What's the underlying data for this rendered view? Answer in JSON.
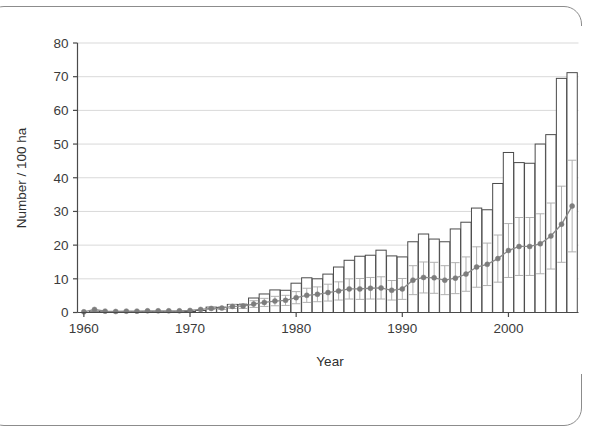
{
  "figure": {
    "background_color": "#ffffff",
    "frame_color": "#8c8c8c"
  },
  "chart_data": {
    "type": "bar",
    "title": "",
    "subtitle": "",
    "xlabel": "Year",
    "ylabel": "Number / 100 ha",
    "xlim": [
      1959.4,
      2006.6
    ],
    "ylim": [
      0,
      80
    ],
    "xticks": [
      1960,
      1970,
      1980,
      1990,
      2000
    ],
    "xtick_labels": [
      "1960",
      "1970",
      "1980",
      "1990",
      "2000"
    ],
    "yticks": [
      0,
      10,
      20,
      30,
      40,
      50,
      60,
      70,
      80
    ],
    "ytick_labels": [
      "0",
      "10",
      "20",
      "30",
      "40",
      "50",
      "60",
      "70",
      "80"
    ],
    "grid": "horizontal",
    "grid_color": "#d9d9d9",
    "legend": "none",
    "categories": [
      1960,
      1961,
      1962,
      1963,
      1964,
      1965,
      1966,
      1967,
      1968,
      1969,
      1970,
      1971,
      1972,
      1973,
      1974,
      1975,
      1976,
      1977,
      1978,
      1979,
      1980,
      1981,
      1982,
      1983,
      1984,
      1985,
      1986,
      1987,
      1988,
      1989,
      1990,
      1991,
      1992,
      1993,
      1994,
      1995,
      1996,
      1997,
      1998,
      1999,
      2000,
      2001,
      2002,
      2003,
      2004,
      2005,
      2006
    ],
    "series": [
      {
        "name": "Number / 100 ha (bars)",
        "type": "bar",
        "color": "#ffffff",
        "edge_color": "#4a4a4a",
        "values": [
          0.0,
          0.4,
          0.2,
          0.2,
          0.2,
          0.2,
          0.2,
          0.2,
          0.2,
          0.2,
          0.3,
          0.6,
          1.6,
          1.5,
          2.4,
          2.3,
          4.3,
          5.5,
          6.7,
          6.6,
          8.7,
          10.3,
          10.0,
          11.4,
          13.5,
          15.5,
          16.7,
          17.0,
          18.5,
          16.8,
          16.5,
          21.0,
          23.3,
          21.8,
          21.0,
          24.8,
          26.8,
          31.0,
          30.5,
          38.3,
          47.5,
          44.5,
          44.3,
          50.0,
          52.8,
          69.5,
          71.2
        ]
      },
      {
        "name": "Index (line with error bars)",
        "type": "line",
        "color": "#8a8a8a",
        "marker": "circle",
        "marker_color": "#7d7d7d",
        "errorbar_color": "#b0b0b0",
        "values": [
          0.2,
          0.9,
          0.4,
          0.3,
          0.4,
          0.4,
          0.5,
          0.5,
          0.5,
          0.5,
          0.6,
          0.9,
          1.2,
          1.3,
          1.8,
          1.9,
          2.5,
          3.0,
          3.4,
          3.6,
          4.4,
          5.1,
          5.4,
          5.9,
          6.4,
          7.0,
          7.0,
          7.2,
          7.3,
          6.6,
          7.0,
          9.6,
          10.4,
          10.3,
          9.6,
          10.2,
          11.4,
          13.5,
          14.3,
          16.0,
          18.4,
          19.6,
          19.6,
          20.4,
          22.7,
          26.2,
          31.6
        ],
        "error_low": [
          0.0,
          0.0,
          0.0,
          0.0,
          0.0,
          0.0,
          0.0,
          0.0,
          0.0,
          0.0,
          0.0,
          0.0,
          0.3,
          0.4,
          0.6,
          0.7,
          1.0,
          1.2,
          1.4,
          1.5,
          1.8,
          2.1,
          2.2,
          2.5,
          2.7,
          3.0,
          3.1,
          3.2,
          3.3,
          2.9,
          3.1,
          4.3,
          4.6,
          4.6,
          4.3,
          4.6,
          5.1,
          6.0,
          6.3,
          7.0,
          8.0,
          8.6,
          8.6,
          8.9,
          9.8,
          11.3,
          13.6
        ],
        "error_high": [
          0.0,
          0.0,
          0.0,
          0.0,
          0.0,
          0.0,
          0.0,
          0.0,
          0.0,
          0.0,
          0.0,
          0.0,
          0.3,
          0.4,
          0.6,
          0.7,
          1.0,
          1.2,
          1.4,
          1.5,
          1.8,
          2.1,
          2.2,
          2.5,
          2.7,
          3.0,
          3.1,
          3.2,
          3.3,
          2.9,
          3.1,
          4.3,
          4.6,
          4.6,
          4.3,
          4.6,
          5.1,
          6.0,
          6.3,
          7.0,
          8.0,
          8.6,
          8.6,
          8.9,
          9.8,
          11.3,
          13.6
        ]
      }
    ]
  }
}
